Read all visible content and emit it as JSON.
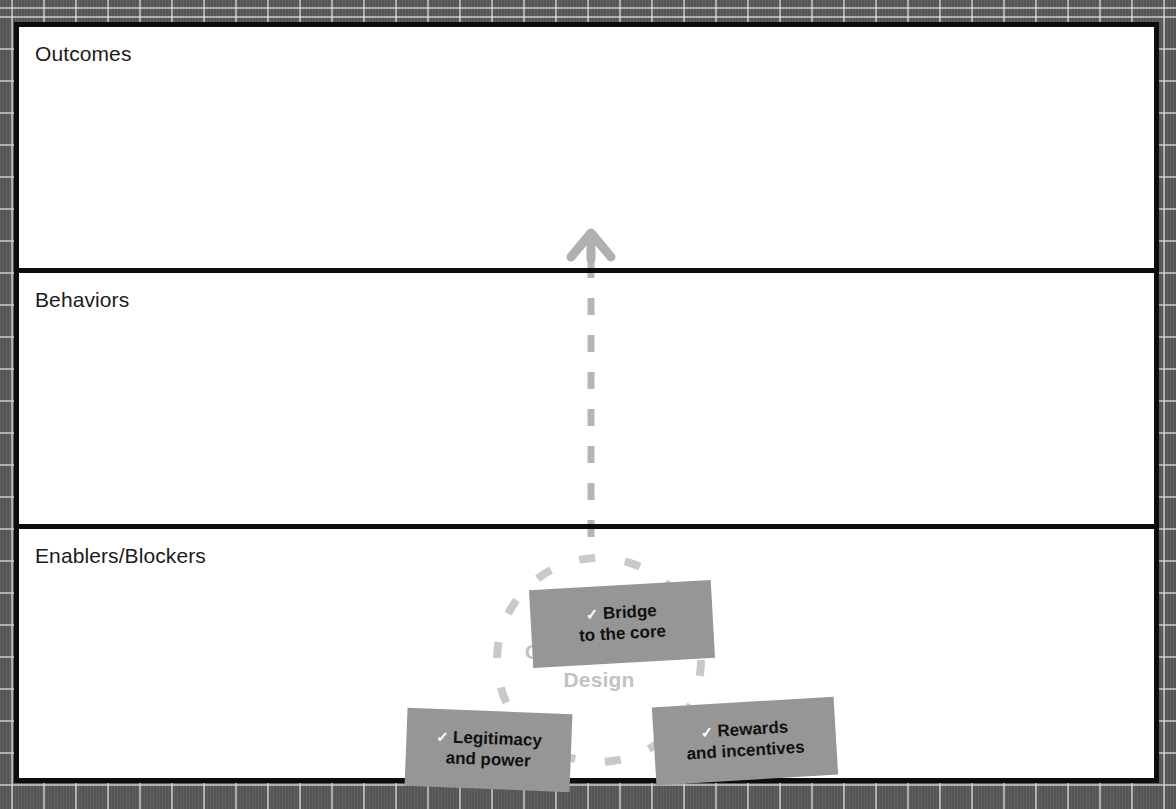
{
  "diagram": {
    "bands": [
      {
        "label": "Outcomes"
      },
      {
        "label": "Behaviors"
      },
      {
        "label": "Enablers/Blockers"
      }
    ],
    "connector": {
      "icon": "up-arrow-icon",
      "style": "dashed",
      "color": "#b5b5b5",
      "direction": "upward"
    },
    "cluster": {
      "title": "Organizational\nDesign",
      "title_color": "#c2c2c2",
      "ring": {
        "icon": "dashed-circle-icon",
        "color": "#c9c9c9",
        "style": "dashed"
      },
      "chips": [
        {
          "check": "✓",
          "label": "Bridge\nto the core",
          "fill": "#969696"
        },
        {
          "check": "✓",
          "label": "Legitimacy\nand power",
          "fill": "#969696"
        },
        {
          "check": "✓",
          "label": "Rewards\nand incentives",
          "fill": "#969696"
        }
      ]
    },
    "colors": {
      "frame": "#0d0d0d",
      "board_background": "#ffffff",
      "page_background": "#5a5a5a",
      "chip_fill": "#969696",
      "muted_text": "#c2c2c2",
      "dash": "#b5b5b5"
    }
  }
}
